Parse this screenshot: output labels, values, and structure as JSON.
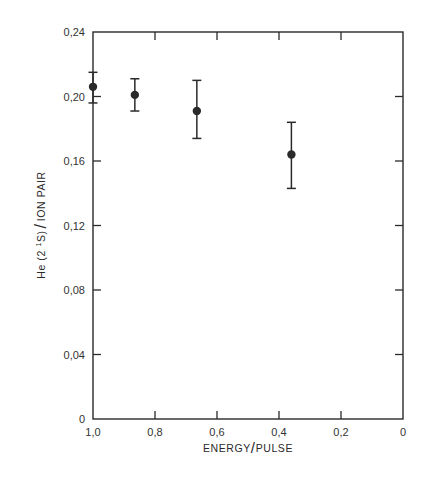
{
  "chart_data": {
    "type": "scatter",
    "title": "",
    "xlabel": "ENERGY/PULSE",
    "ylabel": "He(2 1S)/ION PAIR",
    "ylabel_parts": {
      "prefix": "He (2 ",
      "superscript": "1",
      "suffix": "S)",
      "divider": "/",
      "tail": "ION PAIR"
    },
    "xlabel_parts": {
      "left": "ENERGY",
      "divider": "/",
      "right": "PULSE"
    },
    "xlim": [
      1.0,
      0
    ],
    "ylim": [
      0,
      0.24
    ],
    "x_reversed": true,
    "grid": false,
    "legend": null,
    "x_ticks": [
      1.0,
      0.8,
      0.6,
      0.4,
      0.2,
      0
    ],
    "x_tick_labels": [
      "1,0",
      "0,8",
      "0,6",
      "0,4",
      "0,2",
      "0"
    ],
    "y_ticks": [
      0,
      0.04,
      0.08,
      0.12,
      0.16,
      0.2,
      0.24
    ],
    "y_tick_labels": [
      "0",
      "0,04",
      "0,08",
      "0,12",
      "0,16",
      "0,20",
      "0,24"
    ],
    "series": [
      {
        "name": "He(2 1S) per ion pair",
        "marker": "filled-circle",
        "x": [
          1.0,
          0.865,
          0.665,
          0.36
        ],
        "y": [
          0.206,
          0.201,
          0.191,
          0.164
        ],
        "y_err_upper": [
          0.215,
          0.211,
          0.21,
          0.184
        ],
        "y_err_lower": [
          0.196,
          0.191,
          0.174,
          0.143
        ]
      }
    ]
  },
  "colors": {
    "ink": "#2a2a2a",
    "background": "#ffffff"
  }
}
